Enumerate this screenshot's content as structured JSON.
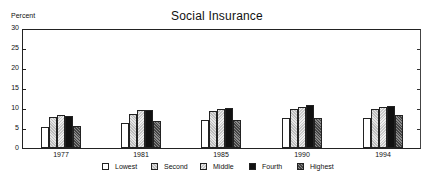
{
  "chart_data": {
    "type": "bar",
    "title": "Social Insurance",
    "ylabel": "Percent",
    "xlabel": "",
    "ylim": [
      0,
      30
    ],
    "yticks": [
      0,
      5,
      10,
      15,
      20,
      25,
      30
    ],
    "categories": [
      "1977",
      "1981",
      "1985",
      "1990",
      "1994"
    ],
    "series": [
      {
        "name": "Lowest",
        "pattern": "white",
        "values": [
          5.2,
          6.2,
          6.9,
          7.6,
          7.6
        ]
      },
      {
        "name": "Second",
        "pattern": "light-stipple",
        "values": [
          7.7,
          8.6,
          9.2,
          9.8,
          9.8
        ]
      },
      {
        "name": "Middle",
        "pattern": "light-hatch",
        "values": [
          8.2,
          9.4,
          9.8,
          10.3,
          10.3
        ]
      },
      {
        "name": "Fourth",
        "pattern": "black",
        "values": [
          7.9,
          9.5,
          9.9,
          10.8,
          10.6
        ]
      },
      {
        "name": "Highest",
        "pattern": "dark-crosshatch",
        "values": [
          5.5,
          6.7,
          7.0,
          7.6,
          8.2
        ]
      }
    ],
    "grid": false,
    "legend_position": "bottom"
  }
}
